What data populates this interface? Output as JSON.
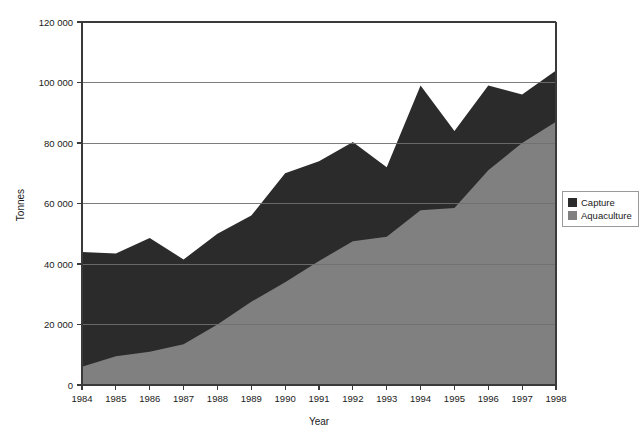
{
  "chart_data": {
    "type": "area",
    "stacked": true,
    "title": "",
    "subtitle": "",
    "xlabel": "Year",
    "ylabel": "Tonnes",
    "categories": [
      "1984",
      "1985",
      "1986",
      "1987",
      "1988",
      "1989",
      "1990",
      "1991",
      "1992",
      "1993",
      "1994",
      "1995",
      "1996",
      "1997",
      "1998"
    ],
    "x": [
      1984,
      1985,
      1986,
      1987,
      1988,
      1989,
      1990,
      1991,
      1992,
      1993,
      1994,
      1995,
      1996,
      1997,
      1998
    ],
    "xlim": [
      1984,
      1998
    ],
    "ylim": [
      0,
      120000
    ],
    "ytick_labels": [
      "0",
      "20 000",
      "40 000",
      "60 000",
      "80 000",
      "100 000",
      "120 000"
    ],
    "ytick_values": [
      0,
      20000,
      40000,
      60000,
      80000,
      100000,
      120000
    ],
    "grid": "horizontal",
    "legend_position": "right",
    "series": [
      {
        "name": "Aquaculture",
        "color": "#808080",
        "values": [
          6000,
          9500,
          11000,
          13500,
          20000,
          27500,
          34000,
          41000,
          47500,
          49000,
          57800,
          58500,
          71000,
          80000,
          87000
        ]
      },
      {
        "name": "Capture",
        "color": "#2b2b2b",
        "values": [
          38000,
          34000,
          37600,
          28000,
          30000,
          28500,
          36000,
          33000,
          32800,
          23000,
          41200,
          25500,
          28000,
          16000,
          17000
        ]
      }
    ],
    "stack_totals": [
      44000,
      43500,
      48600,
      41500,
      50000,
      56000,
      70000,
      74000,
      80300,
      72000,
      99000,
      84000,
      99000,
      96000,
      104000
    ]
  },
  "legend": {
    "items": [
      {
        "label": "Capture",
        "color": "#2b2b2b"
      },
      {
        "label": "Aquaculture",
        "color": "#808080"
      }
    ]
  },
  "axes": {
    "y_title": "Tonnes",
    "x_title": "Year"
  }
}
